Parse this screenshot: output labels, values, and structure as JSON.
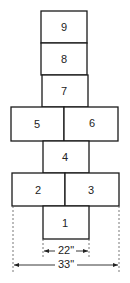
{
  "diagram": {
    "squares": [
      {
        "label": "1",
        "x": 43,
        "y": 206,
        "w": 46,
        "h": 33
      },
      {
        "label": "2",
        "x": 12,
        "y": 173,
        "w": 53,
        "h": 33
      },
      {
        "label": "3",
        "x": 65,
        "y": 173,
        "w": 54,
        "h": 33
      },
      {
        "label": "4",
        "x": 43,
        "y": 141,
        "w": 46,
        "h": 32
      },
      {
        "label": "5",
        "x": 11,
        "y": 107,
        "w": 53,
        "h": 34
      },
      {
        "label": "6",
        "x": 64,
        "y": 107,
        "w": 54,
        "h": 34
      },
      {
        "label": "7",
        "x": 42,
        "y": 75,
        "w": 46,
        "h": 32
      },
      {
        "label": "8",
        "x": 41,
        "y": 43,
        "w": 46,
        "h": 32
      },
      {
        "label": "9",
        "x": 41,
        "y": 11,
        "w": 46,
        "h": 32
      }
    ],
    "dimensions": {
      "inner_width": "22\"",
      "outer_width": "33\""
    },
    "colors": {
      "line": "#1a1a1a",
      "background": "#ffffff"
    }
  }
}
